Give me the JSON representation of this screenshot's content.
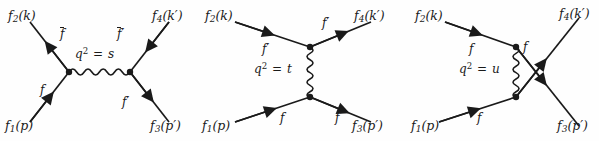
{
  "figure": {
    "background_color": "#fefefe",
    "line_color": "#1a1a1a",
    "text_color": "#1a1a1a"
  },
  "diagrams": [
    {
      "id": "s-channel",
      "channel": "s",
      "propagator_label_prefix": "q",
      "propagator_label_exponent": "2",
      "propagator_label_equals": "=",
      "propagator_label_value": "s",
      "propagator_orientation": "horizontal",
      "external_labels": {
        "top_left": {
          "name": "f",
          "sub": "2",
          "arg": "(k)"
        },
        "bottom_left": {
          "name": "f",
          "sub": "1",
          "arg": "(p)"
        },
        "top_right": {
          "name": "f",
          "sub": "4",
          "arg": "(k′)"
        },
        "bottom_right": {
          "name": "f",
          "sub": "3",
          "arg": "(p′)"
        }
      },
      "internal_labels": {
        "upper_left": {
          "text": "f",
          "bar": true,
          "prime": false
        },
        "lower_left": {
          "text": "f",
          "bar": false,
          "prime": false
        },
        "upper_right": {
          "text": "f",
          "bar": true,
          "prime": true
        },
        "lower_right": {
          "text": "f",
          "bar": false,
          "prime": true
        }
      }
    },
    {
      "id": "t-channel",
      "channel": "t",
      "propagator_label_prefix": "q",
      "propagator_label_exponent": "2",
      "propagator_label_equals": "=",
      "propagator_label_value": "t",
      "propagator_orientation": "vertical",
      "external_labels": {
        "top_left": {
          "name": "f",
          "sub": "2",
          "arg": "(k)"
        },
        "bottom_left": {
          "name": "f",
          "sub": "1",
          "arg": "(p)"
        },
        "top_right": {
          "name": "f",
          "sub": "4",
          "arg": "(k′)"
        },
        "bottom_right": {
          "name": "f",
          "sub": "3",
          "arg": "(p′)"
        }
      },
      "internal_labels": {
        "upper_left": {
          "text": "f",
          "bar": false,
          "prime": true
        },
        "upper_right": {
          "text": "f",
          "bar": false,
          "prime": true
        },
        "lower_left": {
          "text": "f",
          "bar": false,
          "prime": false
        },
        "lower_right": {
          "text": "f",
          "bar": false,
          "prime": false
        }
      }
    },
    {
      "id": "u-channel",
      "channel": "u",
      "propagator_label_prefix": "q",
      "propagator_label_exponent": "2",
      "propagator_label_equals": "=",
      "propagator_label_value": "u",
      "propagator_orientation": "vertical",
      "external_labels": {
        "top_left": {
          "name": "f",
          "sub": "2",
          "arg": "(k)"
        },
        "bottom_left": {
          "name": "f",
          "sub": "1",
          "arg": "(p)"
        },
        "top_right": {
          "name": "f",
          "sub": "4",
          "arg": "(k′)"
        },
        "bottom_right": {
          "name": "f",
          "sub": "3",
          "arg": "(p′)"
        }
      },
      "internal_labels": {
        "upper_left": {
          "text": "f",
          "bar": false,
          "prime": false
        },
        "upper_right": {
          "text": "f",
          "bar": false,
          "prime": false
        },
        "lower_left": {
          "text": "f",
          "bar": false,
          "prime": false
        }
      }
    }
  ]
}
